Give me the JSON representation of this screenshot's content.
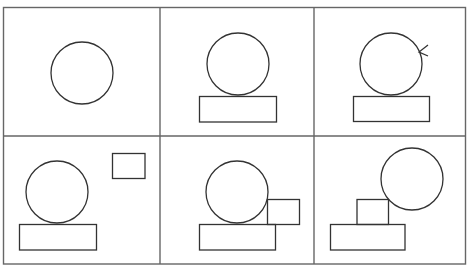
{
  "diagram": {
    "title": "",
    "layout": "2x3 grid of panels",
    "stroke_color": "#333333",
    "grid_color": "#555555",
    "panels": [
      {
        "id": "panel-1",
        "description": "circle alone"
      },
      {
        "id": "panel-2",
        "description": "circle resting on wide rectangle"
      },
      {
        "id": "panel-3",
        "description": "circle on rectangle with arrow pushing circle"
      },
      {
        "id": "panel-4",
        "description": "circle on rectangle with small rectangle floating apart"
      },
      {
        "id": "panel-5",
        "description": "circle on rectangle with small rectangle touching circle"
      },
      {
        "id": "panel-6",
        "description": "small rectangle on wide rectangle, circle displaced up-right"
      }
    ]
  }
}
